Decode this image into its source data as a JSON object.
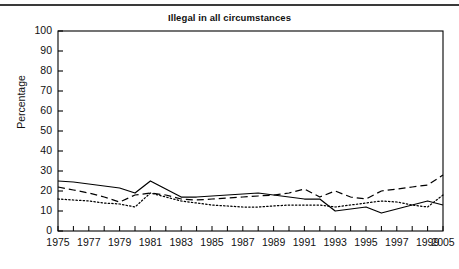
{
  "figure": {
    "title": "Illegal in all circumstances",
    "top_rule": true,
    "background_color": "#ffffff",
    "line_color": "#000000"
  },
  "axes": {
    "y_axis_label": "Percentage",
    "y_ticks": [
      0,
      10,
      20,
      30,
      40,
      50,
      60,
      70,
      80,
      90,
      100
    ],
    "y_tick_labels": [
      "0",
      "10",
      "20",
      "30",
      "40",
      "50",
      "60",
      "70",
      "80",
      "90",
      "100"
    ],
    "x_tick_labels": [
      "1975",
      "1977",
      "1979",
      "1981",
      "1983",
      "1985",
      "1987",
      "1989",
      "1991",
      "1993",
      "1995",
      "1997",
      "1999",
      "2005"
    ],
    "x_minor_ticks_every_year": true
  },
  "chart_data": {
    "type": "line",
    "title": "Illegal in all circumstances",
    "xlabel": "",
    "ylabel": "Percentage",
    "ylim": [
      0,
      100
    ],
    "grid": false,
    "legend": "none",
    "x": [
      "1975",
      "1976",
      "1977",
      "1978",
      "1979",
      "1980",
      "1981",
      "1982",
      "1983",
      "1984",
      "1985",
      "1986",
      "1987",
      "1988",
      "1989",
      "1990",
      "1991",
      "1992",
      "1993",
      "1994",
      "1995",
      "1996",
      "1997",
      "1998",
      "1999",
      "2005"
    ],
    "x_labeled": [
      "1975",
      "1977",
      "1979",
      "1981",
      "1983",
      "1985",
      "1987",
      "1989",
      "1991",
      "1993",
      "1995",
      "1997",
      "1999",
      "2005"
    ],
    "series": [
      {
        "name": "series-solid",
        "style": "solid",
        "values": [
          25,
          24.5,
          23.5,
          22.5,
          21.5,
          19,
          25,
          21,
          17,
          17,
          17.5,
          18,
          18.5,
          19,
          18,
          17,
          16,
          16,
          10,
          11,
          12,
          9,
          11,
          13,
          15,
          13
        ]
      },
      {
        "name": "series-dashed",
        "style": "dashed",
        "values": [
          22,
          20.5,
          19,
          17,
          14.5,
          18,
          19,
          18,
          16,
          15.5,
          16,
          16.5,
          17,
          17.5,
          18,
          19,
          21,
          17,
          20,
          17,
          16,
          20,
          21,
          22,
          23,
          28
        ]
      },
      {
        "name": "series-dotted",
        "style": "dotted",
        "values": [
          16,
          15.5,
          15,
          14,
          13.5,
          12,
          19,
          17,
          15,
          14,
          13,
          12.5,
          12,
          12,
          12.5,
          13,
          13,
          13,
          12,
          13,
          14,
          15,
          14.5,
          13,
          12,
          18
        ]
      }
    ]
  }
}
